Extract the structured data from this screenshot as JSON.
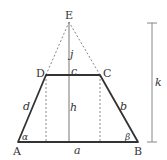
{
  "diagram": {
    "type": "trapezoid-geometry",
    "vertices": {
      "A": {
        "label": "A",
        "x": 18,
        "y": 142
      },
      "B": {
        "label": "B",
        "x": 138,
        "y": 142
      },
      "C": {
        "label": "C",
        "x": 100,
        "y": 75
      },
      "D": {
        "label": "D",
        "x": 46,
        "y": 75
      },
      "E": {
        "label": "E",
        "x": 69,
        "y": 22
      }
    },
    "sides": {
      "a": "a",
      "b": "b",
      "c": "c",
      "d": "d"
    },
    "heights": {
      "h": "h",
      "j": "j",
      "k": "k"
    },
    "angles": {
      "alpha": "α",
      "beta": "β"
    },
    "colors": {
      "stroke": "#333333",
      "thin": "#777777",
      "dashed": "#888888"
    }
  }
}
